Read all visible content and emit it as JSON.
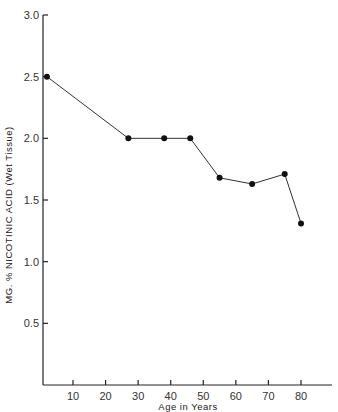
{
  "chart_data": {
    "type": "line",
    "title": "",
    "xlabel": "Age in Years",
    "ylabel": "MG. % NICOTINIC ACID (Wet Tissue)",
    "x_ticks": [
      10,
      20,
      30,
      40,
      50,
      60,
      70,
      80
    ],
    "x_tick_labels": [
      "10",
      "20",
      "30",
      "40",
      "50",
      "60",
      "70",
      "80"
    ],
    "y_ticks": [
      0.5,
      1.0,
      1.5,
      2.0,
      2.5,
      3.0
    ],
    "y_tick_labels": [
      "0.5",
      "1.0",
      "1.5",
      "2.0",
      "2.5",
      "3.0"
    ],
    "xlim": [
      1,
      90
    ],
    "ylim": [
      0,
      3.0
    ],
    "grid": false,
    "legend": null,
    "series": [
      {
        "name": "Nicotinic acid",
        "x": [
          2,
          27,
          38,
          46,
          55,
          65,
          75,
          80
        ],
        "y": [
          2.5,
          2.0,
          2.0,
          2.0,
          1.68,
          1.63,
          1.71,
          1.31
        ]
      }
    ]
  }
}
